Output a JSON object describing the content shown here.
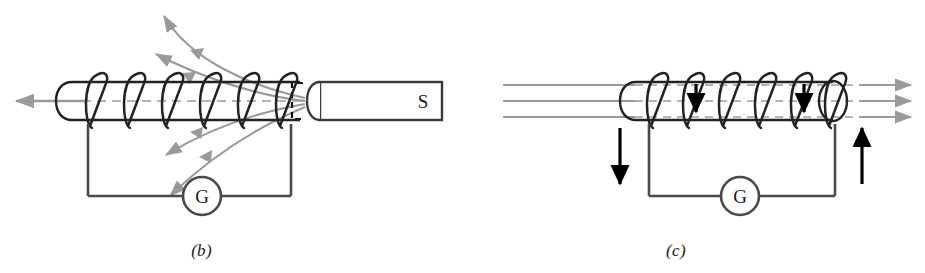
{
  "figure": {
    "background_color": "#ffffff",
    "ink_color": "#3a3a3a",
    "field_line_color": "#9a9a9a",
    "arrow_color": "#000000"
  },
  "panels": [
    {
      "id": "b",
      "caption": "(b)",
      "magnet": {
        "pole_label": "S",
        "hidden_pole_marker": "dashed-bracket",
        "position": "right"
      },
      "meter": {
        "label": "G",
        "name": "galvanometer"
      },
      "motion_arrow": {
        "direction": "left",
        "label": ""
      },
      "field_lines": {
        "count": 4,
        "shape": "curved",
        "arrow_direction": "away-from-magnet-left",
        "color": "#9a9a9a"
      },
      "coil": {
        "turns": 6
      },
      "circuit_current_arrows": []
    },
    {
      "id": "c",
      "caption": "(c)",
      "magnet": null,
      "meter": {
        "label": "G",
        "name": "galvanometer"
      },
      "field_lines": {
        "count": 3,
        "shape": "straight",
        "arrow_direction": "right",
        "color": "#9a9a9a"
      },
      "coil": {
        "turns": 6,
        "current_arrows": [
          {
            "direction": "down",
            "turn_index": 2
          },
          {
            "direction": "down",
            "turn_index": 5
          }
        ]
      },
      "circuit_current_arrows": [
        {
          "direction": "down",
          "side": "left"
        },
        {
          "direction": "up",
          "side": "right"
        }
      ]
    }
  ]
}
